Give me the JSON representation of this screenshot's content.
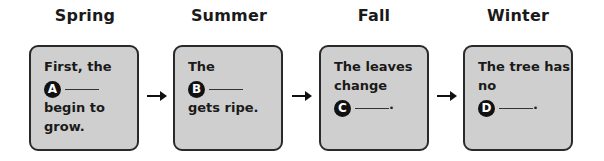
{
  "seasons": [
    {
      "title": "Spring",
      "lines_before": [
        "First, the"
      ],
      "badge": "A",
      "after_blank": "",
      "lines_after": [
        "begin to",
        "grow."
      ]
    },
    {
      "title": "Summer",
      "lines_before": [
        "The"
      ],
      "badge": "B",
      "after_blank": "",
      "lines_after": [
        "gets ripe."
      ]
    },
    {
      "title": "Fall",
      "lines_before": [
        "The leaves",
        "change"
      ],
      "badge": "C",
      "after_blank": ".",
      "lines_after": []
    },
    {
      "title": "Winter",
      "lines_before": [
        "The tree has",
        "no"
      ],
      "badge": "D",
      "after_blank": ".",
      "lines_after": []
    }
  ],
  "colors": {
    "box_fill": "#cfcfcf",
    "border": "#2a2a2a",
    "badge": "#111111"
  }
}
